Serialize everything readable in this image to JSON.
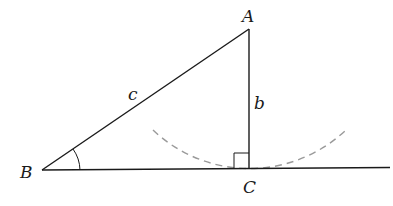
{
  "diagram": {
    "type": "right-triangle-construction",
    "vertices": {
      "A": {
        "label": "A",
        "x": 249,
        "y": 29
      },
      "B": {
        "label": "B",
        "x": 42,
        "y": 170
      },
      "C": {
        "label": "C",
        "x": 249,
        "y": 169
      }
    },
    "sides": {
      "c": {
        "label": "c",
        "from": "B",
        "to": "A"
      },
      "b": {
        "label": "b",
        "from": "A",
        "to": "C"
      }
    },
    "baseline": {
      "from": "B",
      "to_x": 390
    },
    "right_angle_at": "C",
    "angle_marked_at": "B",
    "dashed_arc": {
      "center": "A",
      "radius": 140,
      "color": "#999999"
    },
    "colors": {
      "line": "#1a1a1a",
      "dashed": "#9a9a9a",
      "background": "#ffffff"
    }
  }
}
